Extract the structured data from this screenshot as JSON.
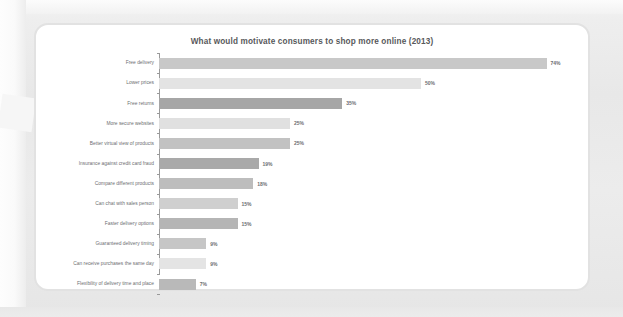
{
  "card": {
    "title": "What would motivate consumers to shop more online (2013)"
  },
  "colors": {
    "background": "#e9e9e9",
    "card_background": "#ffffff",
    "card_border": "#e2e2e2",
    "title_text": "#58595b",
    "label_text": "#6d6e71",
    "axis_line": "#9a9a9a",
    "bar_light": "#e3e3e3",
    "bar_medium": "#c8c8c8",
    "bar_dark": "#a6a6a6"
  },
  "chart_data": {
    "type": "bar",
    "orientation": "horizontal",
    "title": "What would motivate consumers to shop more online (2013)",
    "xlabel": "",
    "ylabel": "",
    "xlim": [
      0,
      80
    ],
    "grid": false,
    "legend": null,
    "value_suffix": "%",
    "categories": [
      "Free delivery",
      "Lower prices",
      "Free returns",
      "More secure websites",
      "Better virtual view of products",
      "Insurance against credit card fraud",
      "Compare different products",
      "Can chat with sales person",
      "Faster delivery options",
      "Guaranteed delivery timing",
      "Can receive purchases the same day",
      "Flexibility of delivery time and place"
    ],
    "values": [
      74,
      50,
      35,
      25,
      25,
      19,
      18,
      15,
      15,
      9,
      9,
      7
    ],
    "value_labels": [
      "74%",
      "50%",
      "35%",
      "25%",
      "25%",
      "19%",
      "18%",
      "15%",
      "15%",
      "9%",
      "9%",
      "7%"
    ],
    "bar_colors": [
      "#c8c8c8",
      "#e3e3e3",
      "#a6a6a6",
      "#e0e0e0",
      "#c2c2c2",
      "#a9a9a9",
      "#bdbdbd",
      "#cfcfcf",
      "#b5b5b5",
      "#c6c6c6",
      "#e4e4e4",
      "#b9b9b9"
    ]
  }
}
